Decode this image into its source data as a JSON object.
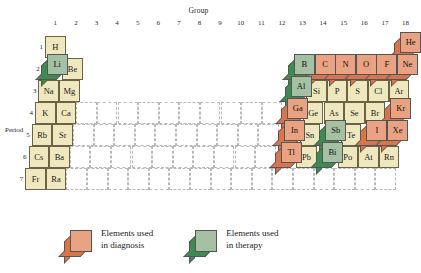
{
  "axes": {
    "group_label": "Group",
    "period_label": "Period",
    "groups": [
      "1",
      "2",
      "3",
      "4",
      "5",
      "6",
      "7",
      "8",
      "9",
      "10",
      "11",
      "12",
      "13",
      "14",
      "15",
      "16",
      "17",
      "18"
    ],
    "periods": [
      "1",
      "2",
      "3",
      "4",
      "5",
      "6",
      "7"
    ]
  },
  "colors": {
    "diagnosis_top": "#e9a383",
    "diagnosis_side": "#d9754c",
    "therapy_top": "#a6c0a4",
    "therapy_side": "#3f8a52",
    "plain_cell": "#efe8bf",
    "cell_border": "#6b6444",
    "grid_dash": "#b9b9b9"
  },
  "legend": {
    "items": [
      {
        "style": "diagnosis",
        "line1": "Elements used",
        "line2": "in diagnosis"
      },
      {
        "style": "therapy",
        "line1": "Elements used",
        "line2": "in therapy"
      }
    ]
  },
  "elements": {
    "flat": [
      {
        "symbol": "H",
        "group": 1,
        "period": 1
      },
      {
        "symbol": "Be",
        "group": 2,
        "period": 2
      },
      {
        "symbol": "Na",
        "group": 1,
        "period": 3
      },
      {
        "symbol": "Mg",
        "group": 2,
        "period": 3
      },
      {
        "symbol": "K",
        "group": 1,
        "period": 4
      },
      {
        "symbol": "Ca",
        "group": 2,
        "period": 4
      },
      {
        "symbol": "Rb",
        "group": 1,
        "period": 5
      },
      {
        "symbol": "Sr",
        "group": 2,
        "period": 5
      },
      {
        "symbol": "Cs",
        "group": 1,
        "period": 6
      },
      {
        "symbol": "Ba",
        "group": 2,
        "period": 6
      },
      {
        "symbol": "Fr",
        "group": 1,
        "period": 7
      },
      {
        "symbol": "Ra",
        "group": 2,
        "period": 7
      },
      {
        "symbol": "Si",
        "group": 14,
        "period": 3
      },
      {
        "symbol": "P",
        "group": 15,
        "period": 3
      },
      {
        "symbol": "S",
        "group": 16,
        "period": 3
      },
      {
        "symbol": "Cl",
        "group": 17,
        "period": 3
      },
      {
        "symbol": "Ar",
        "group": 18,
        "period": 3
      },
      {
        "symbol": "Ge",
        "group": 14,
        "period": 4
      },
      {
        "symbol": "As",
        "group": 15,
        "period": 4
      },
      {
        "symbol": "Se",
        "group": 16,
        "period": 4
      },
      {
        "symbol": "Br",
        "group": 17,
        "period": 4
      },
      {
        "symbol": "Sn",
        "group": 14,
        "period": 5
      },
      {
        "symbol": "Te",
        "group": 16,
        "period": 5
      },
      {
        "symbol": "Pb",
        "group": 14,
        "period": 6
      },
      {
        "symbol": "Po",
        "group": 16,
        "period": 6
      },
      {
        "symbol": "At",
        "group": 17,
        "period": 6
      },
      {
        "symbol": "Rn",
        "group": 18,
        "period": 6
      }
    ],
    "raised": [
      {
        "symbol": "Li",
        "group": 1,
        "period": 2,
        "style": "therapy"
      },
      {
        "symbol": "He",
        "group": 18,
        "period": 1,
        "style": "diagnosis"
      },
      {
        "symbol": "B",
        "group": 13,
        "period": 2,
        "style": "therapy"
      },
      {
        "symbol": "C",
        "group": 14,
        "period": 2,
        "style": "diagnosis"
      },
      {
        "symbol": "N",
        "group": 15,
        "period": 2,
        "style": "diagnosis"
      },
      {
        "symbol": "O",
        "group": 16,
        "period": 2,
        "style": "diagnosis"
      },
      {
        "symbol": "F",
        "group": 17,
        "period": 2,
        "style": "diagnosis"
      },
      {
        "symbol": "Ne",
        "group": 18,
        "period": 2,
        "style": "diagnosis"
      },
      {
        "symbol": "Al",
        "group": 13,
        "period": 3,
        "style": "therapy"
      },
      {
        "symbol": "Ga",
        "group": 13,
        "period": 4,
        "style": "diagnosis"
      },
      {
        "symbol": "Kr",
        "group": 18,
        "period": 4,
        "style": "diagnosis"
      },
      {
        "symbol": "In",
        "group": 13,
        "period": 5,
        "style": "diagnosis"
      },
      {
        "symbol": "Sb",
        "group": 15,
        "period": 5,
        "style": "therapy"
      },
      {
        "symbol": "I",
        "group": 17,
        "period": 5,
        "style": "diagnosis"
      },
      {
        "symbol": "Xe",
        "group": 18,
        "period": 5,
        "style": "diagnosis"
      },
      {
        "symbol": "Tl",
        "group": 13,
        "period": 6,
        "style": "diagnosis"
      },
      {
        "symbol": "Bi",
        "group": 15,
        "period": 6,
        "style": "therapy"
      }
    ]
  }
}
